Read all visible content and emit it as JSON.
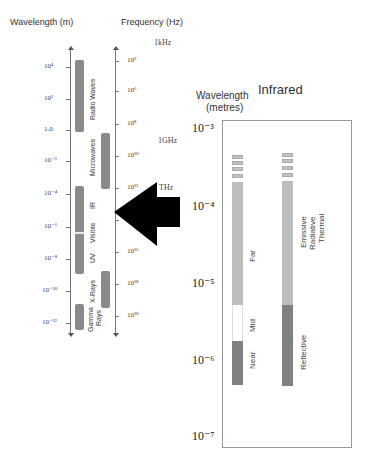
{
  "left_panel": {
    "wavelength_header": "Wavelength (m)",
    "frequency_header": "Frequency (Hz)",
    "wavelength_ticks": [
      "10⁴",
      "10²",
      "1.0",
      "10⁻²",
      "10⁻⁴",
      "10⁻⁶",
      "10⁻⁸",
      "10⁻¹⁰",
      "10⁻¹²"
    ],
    "frequency_ticks": [
      "10⁵",
      "10⁶",
      "10⁸",
      "10¹⁰",
      "10¹²",
      "10¹⁴",
      "10¹⁶",
      "10¹⁸",
      "10²⁰"
    ],
    "frequency_notes": [
      "1kHz",
      "1GHz",
      "THz"
    ],
    "bands": {
      "radio": "Radio Waves",
      "microwaves": "Microwaves",
      "ir": "IR",
      "visible": "Visible",
      "uv": "UV",
      "xrays": "X-Rays",
      "gamma_line1": "Gamma",
      "gamma_line2": "Rays"
    }
  },
  "arrow": {
    "direction": "left",
    "color": "#000000",
    "icon": "arrow-left-icon"
  },
  "right_panel": {
    "axis_title_line1": "Wavelength",
    "axis_title_line2": "(metres)",
    "title": "Infrared",
    "ticks": [
      "10⁻³",
      "10⁻⁴",
      "10⁻⁵",
      "10⁻⁶",
      "10⁻⁷"
    ],
    "column1": {
      "far": "Far",
      "mid": "Mid",
      "near": "Near"
    },
    "column2": {
      "emissive_line1": "Emissive",
      "emissive_line2": "Radiative",
      "emissive_line3": "Thermal",
      "reflective": "Reflective"
    }
  },
  "colors": {
    "bar_dark": "#8a8a8a",
    "bar_light": "#bdbdbd",
    "bar_darker": "#808080",
    "white": "#ffffff"
  }
}
